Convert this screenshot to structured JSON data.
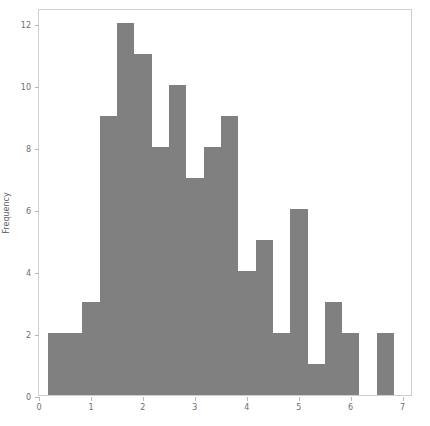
{
  "chart_data": {
    "type": "bar",
    "title": "",
    "xlabel": "",
    "ylabel": "Frequency",
    "xlim": [
      0,
      7.2
    ],
    "ylim": [
      0,
      12.5
    ],
    "grid": false,
    "legend": null,
    "bar_color": "#808080",
    "frame_color": "#cfcfcf",
    "tick_color": "#6e6e6e",
    "xticks": [
      0,
      1,
      2,
      3,
      4,
      5,
      6,
      7
    ],
    "xtick_labels": [
      "0",
      "1",
      "2",
      "3",
      "4",
      "5",
      "6",
      "7"
    ],
    "yticks": [
      0,
      2,
      4,
      6,
      8,
      10,
      12
    ],
    "ytick_labels": [
      "0",
      "2",
      "4",
      "6",
      "8",
      "10",
      "12"
    ],
    "bin_width": 0.3333,
    "bin_edges": [
      0.17,
      0.5,
      0.83,
      1.17,
      1.5,
      1.83,
      2.17,
      2.5,
      2.83,
      3.17,
      3.5,
      3.83,
      4.17,
      4.5,
      4.83,
      5.17,
      5.5,
      5.83,
      6.17,
      6.5,
      6.83,
      7.17
    ],
    "categories": [
      "0.17-0.50",
      "0.50-0.83",
      "0.83-1.17",
      "1.17-1.50",
      "1.50-1.83",
      "1.83-2.17",
      "2.17-2.50",
      "2.50-2.83",
      "2.83-3.17",
      "3.17-3.50",
      "3.50-3.83",
      "3.83-4.17",
      "4.17-4.50",
      "4.50-4.83",
      "4.83-5.17",
      "5.17-5.50",
      "5.50-5.83",
      "5.83-6.17",
      "6.17-6.50",
      "6.50-6.83",
      "6.83-7.17"
    ],
    "values": [
      2,
      2,
      3,
      9,
      12,
      11,
      8,
      10,
      7,
      8,
      9,
      4,
      5,
      2,
      6,
      1,
      3,
      2,
      0,
      2,
      0
    ]
  }
}
